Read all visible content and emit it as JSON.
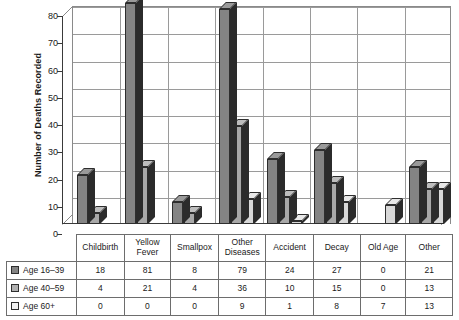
{
  "chart_data": {
    "type": "bar",
    "title": "",
    "xlabel": "",
    "ylabel": "Number of Deaths Recorded",
    "ylim": [
      0,
      80
    ],
    "ytick_step": 10,
    "yticks": [
      80,
      70,
      60,
      50,
      40,
      30,
      20,
      10,
      0
    ],
    "grid": true,
    "legend_position": "table-left-column",
    "style": "3d-clustered-column",
    "categories": [
      "Childbirth",
      "Yellow Fever",
      "Smallpox",
      "Other Diseases",
      "Accident",
      "Decay",
      "Old Age",
      "Other"
    ],
    "category_lines": [
      [
        "Childbirth"
      ],
      [
        "Yellow",
        "Fever"
      ],
      [
        "Smallpox"
      ],
      [
        "Other",
        "Diseases"
      ],
      [
        "Accident"
      ],
      [
        "Decay"
      ],
      [
        "Old Age"
      ],
      [
        "Other"
      ]
    ],
    "series": [
      {
        "name": "Age 16–39",
        "color": "#848484",
        "values": [
          18,
          81,
          8,
          79,
          24,
          27,
          0,
          21
        ]
      },
      {
        "name": "Age 40–59",
        "color": "#b0b0b0",
        "values": [
          4,
          21,
          4,
          36,
          10,
          15,
          0,
          13
        ]
      },
      {
        "name": "Age 60+",
        "color": "#f2f2f2",
        "values": [
          0,
          0,
          0,
          9,
          1,
          8,
          7,
          13
        ]
      }
    ]
  },
  "axis": {
    "y_title": "Number of Deaths Recorded"
  },
  "data_table": {
    "row_labels": [
      "Age 16–39",
      "Age 40–59",
      "Age 60+"
    ],
    "column_headers": [
      "Childbirth",
      "Yellow Fever",
      "Smallpox",
      "Other Diseases",
      "Accident",
      "Decay",
      "Old Age",
      "Other"
    ],
    "rows": [
      {
        "label": "Age 16–39",
        "cells": [
          "18",
          "81",
          "8",
          "79",
          "24",
          "27",
          "0",
          "21"
        ]
      },
      {
        "label": "Age 40–59",
        "cells": [
          "4",
          "21",
          "4",
          "36",
          "10",
          "15",
          "0",
          "13"
        ]
      },
      {
        "label": "Age 60+",
        "cells": [
          "0",
          "0",
          "0",
          "9",
          "1",
          "8",
          "7",
          "13"
        ]
      }
    ]
  },
  "colors": {
    "series_16_39": "#848484",
    "series_40_59": "#b0b0b0",
    "series_60_plus": "#f2f2f2",
    "gridline": "#9a9a9a",
    "axis": "#3a3a3a",
    "table_border": "#6d6d6d"
  }
}
